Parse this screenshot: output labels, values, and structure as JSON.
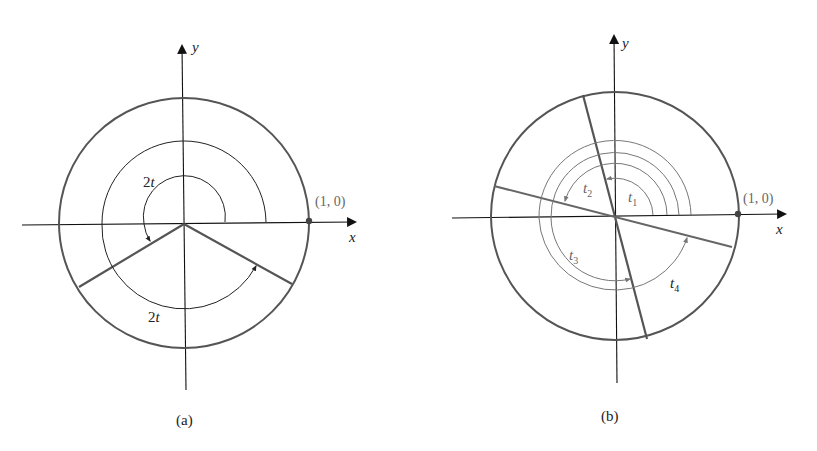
{
  "figure_a": {
    "caption": "(a)",
    "axis_x_label": "x",
    "axis_y_label": "y",
    "point_label": "(1, 0)",
    "arc_label_upper": "2t",
    "arc_label_lower": "2t",
    "colors": {
      "circle": "#555555",
      "axis": "#111111",
      "arc": "#222222"
    }
  },
  "figure_b": {
    "caption": "(b)",
    "axis_x_label": "x",
    "axis_y_label": "y",
    "point_label": "(1, 0)",
    "arc_labels": [
      {
        "name": "t",
        "sub": "1"
      },
      {
        "name": "t",
        "sub": "2"
      },
      {
        "name": "t",
        "sub": "3"
      },
      {
        "name": "t",
        "sub": "4"
      }
    ],
    "colors": {
      "circle": "#555555",
      "axis": "#111111",
      "arc": "#777777"
    }
  }
}
